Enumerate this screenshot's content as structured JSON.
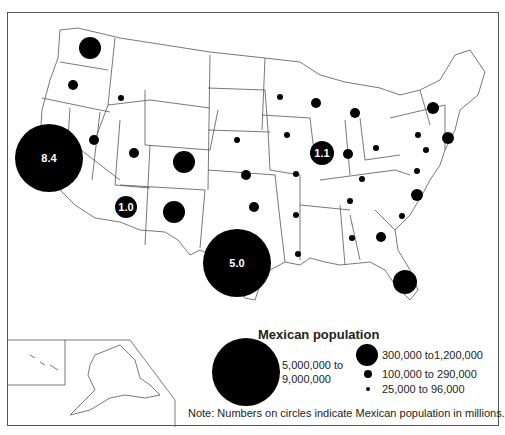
{
  "map": {
    "subject": "Mexican population by U.S. state",
    "circle_labels": {
      "california": "8.4",
      "texas": "5.0",
      "illinois": "1.1",
      "arizona": "1.0"
    }
  },
  "legend": {
    "title": "Mexican population",
    "items": [
      {
        "size": "xlarge",
        "label_line1": "5,000,000 to",
        "label_line2": "9,000,000"
      },
      {
        "size": "large",
        "label": "300,000 to1,200,000"
      },
      {
        "size": "medium",
        "label": "100,000 to 290,000"
      },
      {
        "size": "small",
        "label": "25,000 to 96,000"
      }
    ]
  },
  "note": "Note:  Numbers on circles indicate Mexican population in millions."
}
